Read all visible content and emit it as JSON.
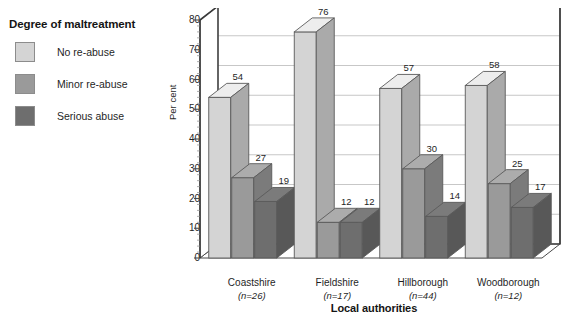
{
  "legend": {
    "title": "Degree of maltreatment",
    "items": [
      {
        "label": "No re-abuse",
        "color": "#d4d4d4"
      },
      {
        "label": "Minor re-abuse",
        "color": "#9a9a9a"
      },
      {
        "label": "Serious abuse",
        "color": "#6e6e6e"
      }
    ]
  },
  "axes": {
    "ylabel": "Per cent",
    "xlabel": "Local authorities",
    "yticks": [
      0,
      10,
      20,
      30,
      40,
      50,
      60,
      70,
      80
    ]
  },
  "categories": [
    {
      "name": "Coastshire",
      "n": "(n=26)"
    },
    {
      "name": "Fieldshire",
      "n": "(n=17)"
    },
    {
      "name": "Hillborough",
      "n": "(n=44)"
    },
    {
      "name": "Woodborough",
      "n": "(n=12)"
    }
  ],
  "chart_data": {
    "type": "bar",
    "title": "Degree of maltreatment",
    "xlabel": "Local authorities",
    "ylabel": "Per cent",
    "ylim": [
      0,
      80
    ],
    "ytick_step": 10,
    "grid": true,
    "legend_position": "left",
    "three_d": true,
    "categories": [
      "Coastshire",
      "Fieldshire",
      "Hillborough",
      "Woodborough"
    ],
    "category_counts": [
      "(n=26)",
      "(n=17)",
      "(n=44)",
      "(n=12)"
    ],
    "series": [
      {
        "name": "No re-abuse",
        "color": "#d4d4d4",
        "values": [
          54,
          76,
          57,
          58
        ]
      },
      {
        "name": "Minor re-abuse",
        "color": "#9a9a9a",
        "values": [
          27,
          12,
          30,
          25
        ]
      },
      {
        "name": "Serious abuse",
        "color": "#6e6e6e",
        "values": [
          19,
          12,
          14,
          17
        ]
      }
    ]
  }
}
